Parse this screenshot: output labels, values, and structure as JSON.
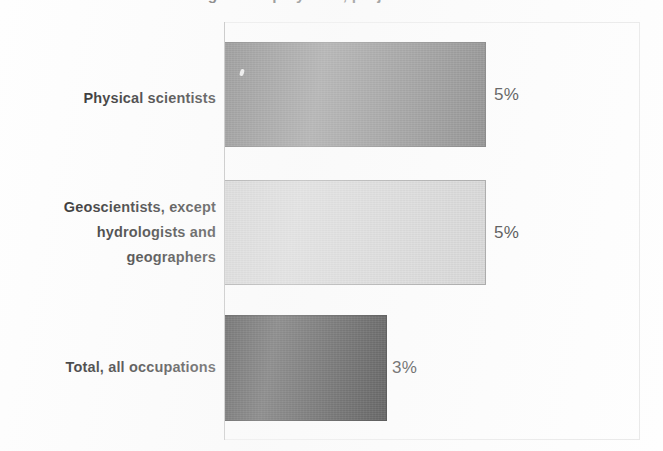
{
  "figure": {
    "title_clipped": "Percent change in employment, projected 2022-32",
    "title_is_cropped": true,
    "background_color": "#fefefe",
    "axis_color": "#b4b4b4",
    "panel_border_color": "#e9e9e9"
  },
  "chart_data": {
    "type": "bar",
    "orientation": "horizontal",
    "title": "Percent change in employment, projected 2022-32",
    "subtitle": "",
    "xlabel": "",
    "ylabel": "",
    "categories": [
      "Physical scientists",
      "Geoscientists, except hydrologists and geographers",
      "Total, all occupations"
    ],
    "values": [
      5,
      3,
      3
    ],
    "value_labels": [
      "5%",
      "5%",
      "3%"
    ],
    "value_unit": "%",
    "xlim": [
      0,
      8
    ],
    "grid": false,
    "legend": false,
    "legend_position": "none",
    "bar_colors": [
      "#6b6b6b",
      "#cecece",
      "#0d0d0d"
    ],
    "bar_border_colors": [
      "#5c5c5c",
      "#8f8f8f",
      "#000000"
    ]
  },
  "bars": [
    {
      "category_lines": [
        "Physical scientists"
      ],
      "value_label": "5%",
      "fill_color": "#6b6b6b",
      "border_color": "#5c5c5c"
    },
    {
      "category_lines": [
        "Geoscientists, except",
        "hydrologists and",
        "geographers"
      ],
      "value_label": "5%",
      "fill_color": "#cecece",
      "border_color": "#8f8f8f"
    },
    {
      "category_lines": [
        "Total, all occupations"
      ],
      "value_label": "3%",
      "fill_color": "#0d0d0d",
      "border_color": "#000000"
    }
  ]
}
